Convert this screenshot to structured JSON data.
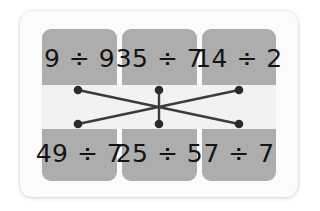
{
  "card": {
    "title": "division-matching-worksheet"
  },
  "grid": {
    "rows": [
      {
        "row_name": "top-row",
        "cells": [
          {
            "expression": "9 ÷ 9",
            "name": "tile-9-div-9"
          },
          {
            "expression": "35 ÷ 7",
            "name": "tile-35-div-7"
          },
          {
            "expression": "14 ÷ 2",
            "name": "tile-14-div-2"
          }
        ]
      },
      {
        "row_name": "bottom-row",
        "cells": [
          {
            "expression": "49 ÷ 7",
            "name": "tile-49-div-7"
          },
          {
            "expression": "25 ÷ 5",
            "name": "tile-25-div-5"
          },
          {
            "expression": "7 ÷ 7",
            "name": "tile-7-div-7"
          }
        ]
      }
    ]
  },
  "connections": [
    {
      "name": "connection-topleft-to-bottomright",
      "from": "top-0",
      "to": "bottom-2"
    },
    {
      "name": "connection-topright-to-bottomleft",
      "from": "top-2",
      "to": "bottom-0"
    },
    {
      "name": "connection-topmiddle-to-bottommiddle",
      "from": "top-1",
      "to": "bottom-1"
    }
  ],
  "nodes": {
    "top": [
      {
        "name": "node-top-left",
        "cx": 36,
        "cy": 5
      },
      {
        "name": "node-top-middle",
        "cx": 117,
        "cy": 5
      },
      {
        "name": "node-top-right",
        "cx": 197,
        "cy": 5
      }
    ],
    "bottom": [
      {
        "name": "node-bottom-left",
        "cx": 36,
        "cy": 39
      },
      {
        "name": "node-bottom-middle",
        "cx": 117,
        "cy": 39
      },
      {
        "name": "node-bottom-right",
        "cx": 197,
        "cy": 39
      }
    ]
  },
  "colors": {
    "card_background": "#fbfbfb",
    "tile_background": "#adadad",
    "band_background": "#f2f2f2",
    "line": "#3c3c3c",
    "node": "#2b2b2b",
    "text": "#141414",
    "page_background": "#ffffff"
  }
}
